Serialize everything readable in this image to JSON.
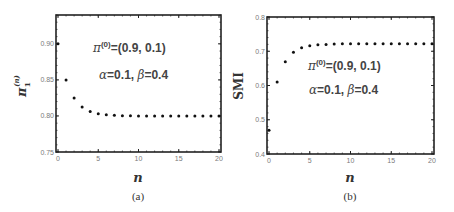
{
  "chart_data": [
    {
      "type": "scatter",
      "panel": "(a)",
      "caption": "(a)",
      "xlabel": "n",
      "ylabel": "π1(n)",
      "xlim": [
        0,
        20
      ],
      "ylim": [
        0.75,
        0.94
      ],
      "xticks": [
        0,
        5,
        10,
        15,
        20
      ],
      "yticks": [
        0.75,
        0.8,
        0.85,
        0.9
      ],
      "ytick_labels": [
        "0.75",
        "0.80",
        "0.85",
        "0.90"
      ],
      "grid": false,
      "annotations": [
        "π(0)=(0.9, 0.1)",
        "α=0.1, β=0.4"
      ],
      "x": [
        0,
        1,
        2,
        3,
        4,
        5,
        6,
        7,
        8,
        9,
        10,
        11,
        12,
        13,
        14,
        15,
        16,
        17,
        18,
        19,
        20
      ],
      "values": [
        0.9,
        0.85,
        0.825,
        0.8125,
        0.8063,
        0.8031,
        0.8016,
        0.8008,
        0.8004,
        0.8002,
        0.8001,
        0.8,
        0.8,
        0.8,
        0.8,
        0.8,
        0.8,
        0.8,
        0.8,
        0.8,
        0.8
      ]
    },
    {
      "type": "scatter",
      "panel": "(b)",
      "caption": "(b)",
      "xlabel": "n",
      "ylabel": "SMI",
      "xlim": [
        0,
        20
      ],
      "ylim": [
        0.4,
        0.8
      ],
      "xticks": [
        0,
        5,
        10,
        15,
        20
      ],
      "yticks": [
        0.4,
        0.5,
        0.6,
        0.7,
        0.8
      ],
      "ytick_labels": [
        "0.4",
        "0.5",
        "0.6",
        "0.7",
        "0.8"
      ],
      "grid": false,
      "annotations": [
        "π(0)=(0.9, 0.1)",
        "α=0.1, β=0.4"
      ],
      "x": [
        0,
        1,
        2,
        3,
        4,
        5,
        6,
        7,
        8,
        9,
        10,
        11,
        12,
        13,
        14,
        15,
        16,
        17,
        18,
        19,
        20
      ],
      "values": [
        0.469,
        0.61,
        0.669,
        0.697,
        0.71,
        0.716,
        0.719,
        0.72,
        0.721,
        0.722,
        0.722,
        0.722,
        0.722,
        0.722,
        0.722,
        0.722,
        0.722,
        0.722,
        0.722,
        0.722,
        0.722
      ]
    }
  ],
  "panels": {
    "a": {
      "ylabel_base": "π",
      "ylabel_sub": "1",
      "ylabel_sup": "(n)",
      "xlabel": "n",
      "caption": "(a)",
      "annot1_pi": "π",
      "annot1_sup": "(0)",
      "annot1_rest": "=(0.9, 0.1)",
      "annot2_alpha": "α",
      "annot2_mid": "=0.1, ",
      "annot2_beta": "β",
      "annot2_end": "=0.4"
    },
    "b": {
      "ylabel": "SMI",
      "xlabel": "n",
      "caption": "(b)",
      "annot1_pi": "π",
      "annot1_sup": "(0)",
      "annot1_rest": "=(0.9, 0.1)",
      "annot2_alpha": "α",
      "annot2_mid": "=0.1, ",
      "annot2_beta": "β",
      "annot2_end": "=0.4"
    }
  }
}
